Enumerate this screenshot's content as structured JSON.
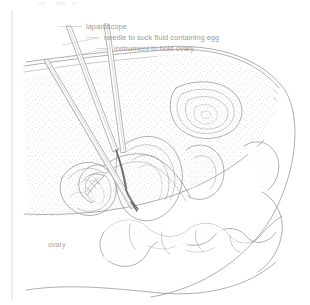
{
  "figure": {
    "domain_note": "medical line illustration",
    "width": 310,
    "height": 305,
    "background_color": "#ffffff",
    "ink_color": "#8c8c8c",
    "label_color": "#9a9a9a",
    "frame_color": "#c9c9c9"
  },
  "labels": [
    {
      "id": "laparoscope",
      "text": "laparoscope",
      "x": 86,
      "y": 29,
      "leader_from_x": 82,
      "leader_from_y": 27,
      "leader_to_x": 58,
      "leader_to_y": 27
    },
    {
      "id": "needle",
      "text": "needle to suck fluid containing egg",
      "x": 104,
      "y": 40,
      "leader_from_x": 100,
      "leader_from_y": 38,
      "leader_to_x": 62,
      "leader_to_y": 46
    },
    {
      "id": "instrument",
      "text": "instrument to hold ovary",
      "x": 114,
      "y": 51,
      "leader_from_x": 110,
      "leader_from_y": 49,
      "leader_to_x": 68,
      "leader_to_y": 57
    }
  ],
  "annotations": [
    {
      "id": "ovary",
      "text": "ovary",
      "x": 48,
      "y": 247
    }
  ],
  "instruments": [
    {
      "id": "laparoscope-shaft",
      "kind": "tube",
      "entry_x": 47,
      "entry_y": 66
    },
    {
      "id": "needle-shaft",
      "kind": "needle",
      "entry_x": 70,
      "entry_y": 64
    },
    {
      "id": "grasper-shaft",
      "kind": "tube",
      "entry_x": 105,
      "entry_y": 62
    }
  ],
  "anatomy": [
    {
      "id": "abdominal-wall",
      "label": "abdominal wall"
    },
    {
      "id": "abdominal-cavity-stipple",
      "label": "abdominal cavity"
    },
    {
      "id": "umbilicus",
      "label": "umbilicus"
    },
    {
      "id": "uterus",
      "label": "uterus"
    },
    {
      "id": "fallopian-tube",
      "label": "fallopian tube"
    },
    {
      "id": "ovary-body",
      "label": "ovary"
    },
    {
      "id": "bowel-loops",
      "label": "bowel"
    },
    {
      "id": "body-outline",
      "label": "body outline"
    }
  ]
}
